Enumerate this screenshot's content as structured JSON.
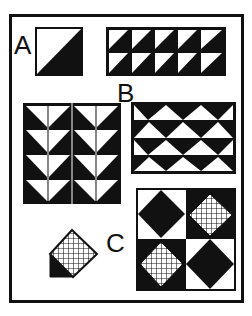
{
  "figure": {
    "colors": {
      "ink": "#111111",
      "paper": "#ffffff"
    },
    "labels": {
      "a": "A",
      "b": "B",
      "c": "C"
    },
    "blocks": [
      {
        "id": "A",
        "type": "half-square-triangle",
        "grid": [
          1,
          1
        ]
      },
      {
        "id": "B1",
        "type": "half-square-triangle-strip",
        "grid": [
          5,
          2
        ]
      },
      {
        "id": "B2",
        "type": "flying-geese-columns",
        "grid": [
          4,
          4
        ]
      },
      {
        "id": "B3",
        "type": "triangle-rows",
        "grid": [
          4,
          4
        ]
      },
      {
        "id": "C1",
        "type": "tilted-square-with-corner",
        "fill": "crosshatch"
      },
      {
        "id": "C2",
        "type": "four-patch-diamonds",
        "grid": [
          2,
          2
        ],
        "fills": [
          "black",
          "crosshatch",
          "crosshatch",
          "black"
        ]
      }
    ]
  }
}
